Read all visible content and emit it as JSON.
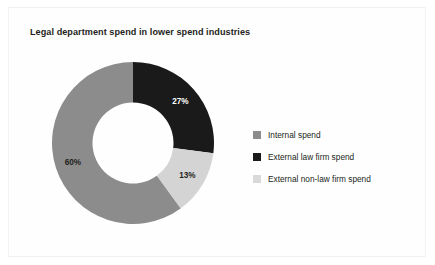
{
  "chart_data": {
    "type": "pie",
    "variant": "donut",
    "title": "Legal department spend in lower spend industries",
    "xlabel": "",
    "ylabel": "",
    "legend_position": "right",
    "grid": false,
    "start_angle_deg": 0,
    "direction": "clockwise",
    "inner_radius_ratio": 0.5,
    "categories": [
      "Internal spend",
      "External law firm spend",
      "External non-law firm spend"
    ],
    "values": [
      60,
      27,
      13
    ],
    "units": "%",
    "data_labels": [
      "60%",
      "27%",
      "13%"
    ],
    "slice_order_clockwise_from_top": [
      "External law firm spend",
      "External non-law firm spend",
      "Internal spend"
    ],
    "slices": [
      {
        "label": "External law firm spend",
        "value": 27,
        "data_label": "27%",
        "color": "#1a1a1a",
        "label_color": "#ffffff"
      },
      {
        "label": "External non-law firm spend",
        "value": 13,
        "data_label": "13%",
        "color": "#d4d4d4",
        "label_color": "#231f20"
      },
      {
        "label": "Internal spend",
        "value": 60,
        "data_label": "60%",
        "color": "#8c8c8c",
        "label_color": "#231f20"
      }
    ]
  },
  "legend": {
    "items": [
      {
        "label": "Internal spend",
        "color": "#8c8c8c"
      },
      {
        "label": "External law firm spend",
        "color": "#1a1a1a"
      },
      {
        "label": "External non-law firm spend",
        "color": "#d9d9d9"
      }
    ]
  },
  "colors": {
    "background": "#ffffff",
    "frame_border": "#f2f2f2",
    "text": "#231f20",
    "internal_spend": "#8c8c8c",
    "external_law_firm_spend": "#1a1a1a",
    "external_non_law_firm_spend": "#d4d4d4"
  }
}
